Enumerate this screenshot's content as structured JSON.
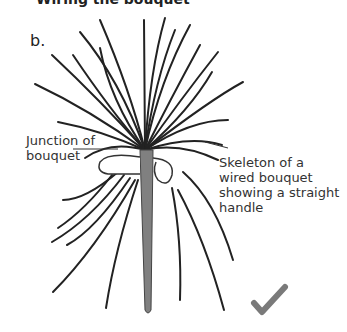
{
  "figure": {
    "cutoff_heading": "Wiring the bouquet",
    "panel_label": "b.",
    "annotations": [
      {
        "id": "junction",
        "text": "Junction of\nbouquet"
      },
      {
        "id": "skeleton",
        "text": "Skeleton of a\nwired bouquet\nshowing a straight\nhandle"
      }
    ],
    "status_mark": "check-mark",
    "colors": {
      "wire": "#222222",
      "handle": "#808080",
      "check": "#7a7a7a",
      "text": "#333333"
    }
  }
}
